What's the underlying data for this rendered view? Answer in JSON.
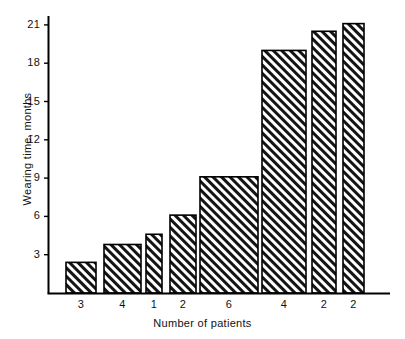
{
  "chart_data": {
    "type": "bar",
    "title": "",
    "xlabel": "Number of patients",
    "ylabel": "Wearing time, months",
    "categories": [
      "3",
      "4",
      "1",
      "2",
      "6",
      "4",
      "2",
      "2"
    ],
    "values": [
      2.4,
      3.8,
      4.6,
      6.1,
      9.1,
      19.0,
      20.5,
      21.1
    ],
    "ytick_labels": [
      "3",
      "6",
      "9",
      "12",
      "15",
      "18",
      "21"
    ],
    "ytick_values": [
      3,
      6,
      9,
      12,
      15,
      18,
      21
    ],
    "ylim": [
      0,
      22
    ],
    "grid": false,
    "legend": false,
    "bar_fill": "diagonal-hatch",
    "bar_edge_color": "#000000",
    "bar_hatch_color": "#1a1a1a",
    "background_color": "#ffffff",
    "bar_widths_px": [
      30,
      37,
      16,
      26,
      58,
      44,
      24,
      21
    ]
  },
  "axes": {
    "y_axis_label": "Wearing time, months",
    "x_axis_label": "Number of patients"
  }
}
